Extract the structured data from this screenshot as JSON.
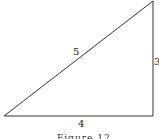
{
  "figure": {
    "caption": "Figure 12",
    "shape": "right-triangle",
    "sides": {
      "hypotenuse": "5",
      "vertical": "3",
      "base": "4"
    },
    "stroke_color": "#333333"
  }
}
